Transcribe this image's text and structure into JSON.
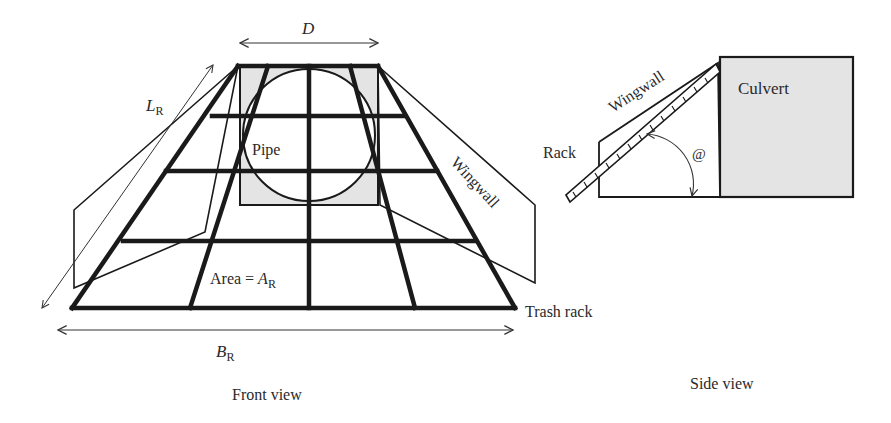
{
  "front_view": {
    "caption": "Front view",
    "dim_top": {
      "symbol": "D"
    },
    "dim_slant": {
      "symbol": "L",
      "subscript": "R"
    },
    "dim_bottom": {
      "symbol": "B",
      "subscript": "R"
    },
    "pipe_label": "Pipe",
    "area_label_prefix": "Area = ",
    "area_symbol": "A",
    "area_subscript": "R",
    "wingwall_label": "Wingwall",
    "trash_rack_label": "Trash rack"
  },
  "side_view": {
    "caption": "Side view",
    "rack_label": "Rack",
    "wingwall_label": "Wingwall",
    "culvert_label": "Culvert",
    "angle_symbol": "@"
  },
  "colors": {
    "line": "#1a1a1a",
    "shade": "#e4e4e4",
    "text": "#2a2a2a"
  }
}
